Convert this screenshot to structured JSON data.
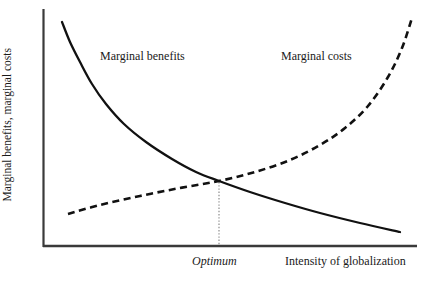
{
  "figure": {
    "width": 426,
    "height": 282,
    "background_color": "#ffffff",
    "axis_color": "#3a3a3a",
    "curve_color": "#111111",
    "guide_color": "#8c8c8c"
  },
  "labels": {
    "y_axis_title": "Marginal benefits, marginal costs",
    "x_axis_title": "Intensity of globalization",
    "marginal_benefits": "Marginal benefits",
    "marginal_costs": "Marginal costs",
    "optimum": "Optimum"
  },
  "chart_data": {
    "type": "line",
    "title": "",
    "subtitle": "",
    "xlabel": "Intensity of globalization",
    "ylabel": "Marginal benefits, marginal costs",
    "grid": false,
    "legend_position": "in-plot annotations",
    "axes": {
      "x_origin_px": 43,
      "x_end_px": 417,
      "y_origin_px": 246,
      "y_top_px": 9,
      "ticks": [],
      "tick_labels": [],
      "arrowheads": false,
      "xlim": [
        0,
        1
      ],
      "ylim": [
        0,
        1
      ]
    },
    "annotations": [
      {
        "name": "marginal-benefits-label",
        "text": "Marginal benefits",
        "x_px": 100,
        "y_px": 50,
        "style": "normal"
      },
      {
        "name": "marginal-costs-label",
        "text": "Marginal costs",
        "x_px": 281,
        "y_px": 50,
        "style": "normal"
      },
      {
        "name": "optimum-label",
        "text": "Optimum",
        "x_px": 192,
        "y_px": 255,
        "style": "italic"
      }
    ],
    "intersection": {
      "name": "Optimum",
      "x_px": 219,
      "y_px": 181,
      "x_value": 0.47,
      "y_value": 0.275
    },
    "guide_line": {
      "name": "optimum-dropline",
      "style": "dotted",
      "x_px": 219,
      "from_y_px": 182,
      "to_y_px": 246
    },
    "series": [
      {
        "name": "Marginal benefits",
        "style": "solid",
        "shape": "convex decreasing",
        "points_px": [
          [
            62,
            22
          ],
          [
            70,
            42
          ],
          [
            80,
            62
          ],
          [
            92,
            84
          ],
          [
            106,
            104
          ],
          [
            124,
            124
          ],
          [
            146,
            142
          ],
          [
            172,
            159
          ],
          [
            196,
            172
          ],
          [
            219,
            181
          ],
          [
            250,
            192
          ],
          [
            285,
            203
          ],
          [
            320,
            213
          ],
          [
            360,
            223
          ],
          [
            400,
            232
          ]
        ],
        "points_data": [
          [
            0.051,
            0.945
          ],
          [
            0.072,
            0.861
          ],
          [
            0.099,
            0.776
          ],
          [
            0.131,
            0.684
          ],
          [
            0.168,
            0.599
          ],
          [
            0.217,
            0.515
          ],
          [
            0.275,
            0.439
          ],
          [
            0.345,
            0.367
          ],
          [
            0.409,
            0.312
          ],
          [
            0.47,
            0.274
          ],
          [
            0.553,
            0.228
          ],
          [
            0.647,
            0.181
          ],
          [
            0.741,
            0.139
          ],
          [
            0.848,
            0.097
          ],
          [
            0.955,
            0.059
          ]
        ]
      },
      {
        "name": "Marginal costs",
        "style": "dashed",
        "shape": "convex increasing",
        "points_px": [
          [
            68,
            214
          ],
          [
            100,
            205
          ],
          [
            140,
            196
          ],
          [
            180,
            188
          ],
          [
            219,
            181
          ],
          [
            255,
            172
          ],
          [
            290,
            160
          ],
          [
            320,
            145
          ],
          [
            345,
            128
          ],
          [
            368,
            106
          ],
          [
            388,
            77
          ],
          [
            402,
            48
          ],
          [
            412,
            18
          ]
        ],
        "points_data": [
          [
            0.067,
            0.135
          ],
          [
            0.152,
            0.173
          ],
          [
            0.259,
            0.211
          ],
          [
            0.366,
            0.245
          ],
          [
            0.47,
            0.274
          ],
          [
            0.567,
            0.312
          ],
          [
            0.66,
            0.363
          ],
          [
            0.741,
            0.426
          ],
          [
            0.807,
            0.498
          ],
          [
            0.869,
            0.591
          ],
          [
            0.923,
            0.713
          ],
          [
            0.96,
            0.835
          ],
          [
            0.987,
            0.962
          ]
        ]
      }
    ]
  }
}
